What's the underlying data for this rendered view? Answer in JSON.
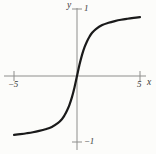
{
  "figure": {
    "name": "coordinate-graph",
    "background_color": "#fcfcfa",
    "ink_color": "#1a1a1a",
    "axis_color": "#8e8e8c"
  },
  "axes": {
    "x_name": "x",
    "y_name": "y",
    "x_ticks": [
      {
        "value": -5,
        "label": "−5"
      },
      {
        "value": 5,
        "label": "5"
      }
    ],
    "y_ticks": [
      {
        "value": 1,
        "label": "1"
      },
      {
        "value": -1,
        "label": "−1"
      }
    ]
  },
  "chart_data": {
    "type": "line",
    "title": "",
    "subtitle": "",
    "xlabel": "x",
    "ylabel": "y",
    "xlim": [
      -5.7,
      5.7
    ],
    "ylim": [
      -1.22,
      1.22
    ],
    "grid": false,
    "legend": null,
    "annotations": [],
    "xticks": [
      -5,
      5
    ],
    "xticklabels": [
      "−5",
      "5"
    ],
    "yticks": [
      -1,
      1
    ],
    "yticklabels": [
      "−1",
      "1"
    ],
    "series": [
      {
        "name": "odd sigmoid curve",
        "color": "#1a1a1a",
        "linewidth": 2.2,
        "x": [
          -5.0,
          -4.5,
          -4.0,
          -3.5,
          -3.0,
          -2.5,
          -2.0,
          -1.5,
          -1.2,
          -1.0,
          -0.8,
          -0.6,
          -0.4,
          -0.2,
          0.0,
          0.2,
          0.4,
          0.6,
          0.8,
          1.0,
          1.2,
          1.5,
          2.0,
          2.5,
          3.0,
          3.5,
          4.0,
          4.5,
          5.0
        ],
        "y": [
          -0.88,
          -0.868,
          -0.855,
          -0.84,
          -0.82,
          -0.795,
          -0.76,
          -0.7,
          -0.645,
          -0.59,
          -0.52,
          -0.43,
          -0.315,
          -0.17,
          0.0,
          0.17,
          0.315,
          0.43,
          0.52,
          0.59,
          0.645,
          0.7,
          0.76,
          0.795,
          0.82,
          0.84,
          0.855,
          0.868,
          0.88
        ]
      }
    ]
  },
  "geometry": {
    "origin_x_px": 77,
    "origin_y_px": 76,
    "x_axis_left_px": 4,
    "x_axis_right_px": 146,
    "y_axis_top_px": 8,
    "y_axis_bottom_px": 150,
    "tick_x_neg5_px": 14,
    "tick_x_pos5_px": 140,
    "tick_y_pos1_px": 9,
    "tick_y_neg1_px": 142
  }
}
